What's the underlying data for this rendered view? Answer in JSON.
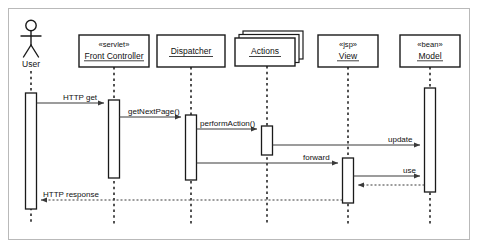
{
  "diagram": {
    "type": "uml-sequence-diagram",
    "title": "",
    "lifelines": [
      {
        "id": "user",
        "kind": "actor",
        "name": "User",
        "stereotype": "",
        "underlined": false,
        "stacked": false,
        "x": 31,
        "activation": {
          "top": 93,
          "bottom": 209
        }
      },
      {
        "id": "front-controller",
        "kind": "object",
        "name": "Front Controller",
        "stereotype": "«servlet»",
        "underlined": true,
        "stacked": false,
        "x": 114,
        "activation": {
          "top": 100,
          "bottom": 178
        }
      },
      {
        "id": "dispatcher",
        "kind": "object",
        "name": "Dispatcher",
        "stereotype": "",
        "underlined": true,
        "stacked": false,
        "x": 191,
        "activation": {
          "top": 115,
          "bottom": 180
        }
      },
      {
        "id": "actions",
        "kind": "object",
        "name": "Actions",
        "stereotype": "",
        "underlined": true,
        "stacked": true,
        "x": 267,
        "activation": {
          "top": 126,
          "bottom": 155
        }
      },
      {
        "id": "view",
        "kind": "object",
        "name": "View",
        "stereotype": "«jsp»",
        "underlined": true,
        "stacked": false,
        "x": 348,
        "activation": {
          "top": 158,
          "bottom": 203
        }
      },
      {
        "id": "model",
        "kind": "object",
        "name": "Model",
        "stereotype": "«bean»",
        "underlined": true,
        "stacked": false,
        "x": 430,
        "activation": {
          "top": 88,
          "bottom": 192
        }
      }
    ],
    "messages": [
      {
        "id": "m1",
        "label": "HTTP get",
        "from": "user",
        "to": "front-controller",
        "y": 103,
        "style": "solid",
        "direction": "right"
      },
      {
        "id": "m2",
        "label": "getNextPage()",
        "from": "front-controller",
        "to": "dispatcher",
        "y": 117,
        "style": "solid",
        "direction": "right"
      },
      {
        "id": "m3",
        "label": "performAction()",
        "from": "dispatcher",
        "to": "actions",
        "y": 129,
        "style": "solid",
        "direction": "right"
      },
      {
        "id": "m4",
        "label": "update",
        "from": "actions",
        "to": "model",
        "y": 145,
        "style": "solid",
        "direction": "right"
      },
      {
        "id": "m5",
        "label": "forward",
        "from": "dispatcher",
        "to": "view",
        "y": 163,
        "style": "solid",
        "direction": "right"
      },
      {
        "id": "m6",
        "label": "use",
        "from": "view",
        "to": "model",
        "y": 176,
        "style": "solid",
        "direction": "right"
      },
      {
        "id": "m7",
        "label": "",
        "from": "model",
        "to": "view",
        "y": 185,
        "style": "dashed",
        "direction": "left"
      },
      {
        "id": "m8",
        "label": "HTTP response",
        "from": "view",
        "to": "user",
        "y": 200,
        "style": "dashed",
        "direction": "left"
      }
    ],
    "colors": {
      "frame_border": "#b9b9b9",
      "stroke": "#1a1a1a",
      "message_stroke": "#3a3a3a",
      "background": "#ffffff",
      "text": "#111111"
    }
  }
}
